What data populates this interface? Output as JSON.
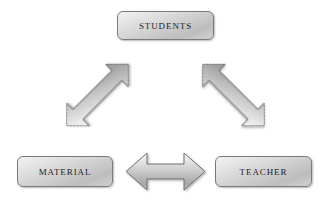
{
  "diagram": {
    "background_color": "#ffffff",
    "nodes": [
      {
        "id": "students",
        "label": "STUDENTS",
        "position": "top-center",
        "icon": "rounded-rectangle-node"
      },
      {
        "id": "material",
        "label": "MATERIAL",
        "position": "bottom-left",
        "icon": "rounded-rectangle-node"
      },
      {
        "id": "teacher",
        "label": "TEACHER",
        "position": "bottom-right",
        "icon": "rounded-rectangle-node"
      }
    ],
    "connectors": [
      {
        "id": "students-material",
        "icon": "double-headed-arrow-icon",
        "from": "STUDENTS",
        "to": "MATERIAL",
        "direction": "bidirectional",
        "orientation": "diagonal-down-left"
      },
      {
        "id": "students-teacher",
        "icon": "double-headed-arrow-icon",
        "from": "STUDENTS",
        "to": "TEACHER",
        "direction": "bidirectional",
        "orientation": "diagonal-down-right"
      },
      {
        "id": "material-teacher",
        "icon": "double-headed-arrow-icon",
        "from": "MATERIAL",
        "to": "TEACHER",
        "direction": "bidirectional",
        "orientation": "horizontal"
      }
    ],
    "colors": {
      "node_fill_light": "#f2f2f2",
      "node_fill_mid": "#cfcfcf",
      "node_fill_dark": "#bdbdbd",
      "node_border": "#7a7a7a",
      "label_text": "#1d1d1d",
      "arrow_fill_light": "#f5f5f5",
      "arrow_fill_mid": "#c8c8c8",
      "arrow_fill_dark": "#9b9b9b",
      "arrow_border": "#6f6f6f"
    }
  }
}
